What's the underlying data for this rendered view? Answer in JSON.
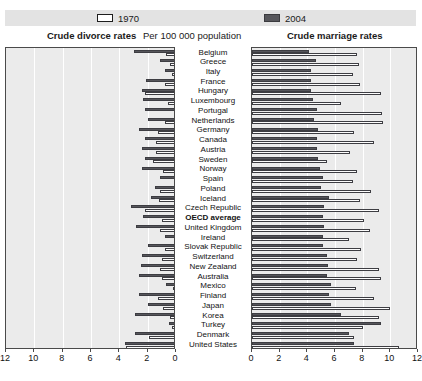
{
  "legend": {
    "items": [
      {
        "label": "1970",
        "swatch": "light-square-icon",
        "color": "#ffffff"
      },
      {
        "label": "2004",
        "swatch": "dark-square-icon",
        "color": "#56565b"
      }
    ]
  },
  "headers": {
    "left_title": "Crude divorce rates",
    "center_title": "Per 100 000 population",
    "right_title": "Crude marriage rates"
  },
  "footnote": "",
  "chart_data": {
    "type": "bar",
    "subtitle": "Per 100 000 population",
    "orientation": "horizontal",
    "layout": "back-to-back paired panels sharing a centered category axis",
    "legend_position": "top",
    "grid": true,
    "panels": [
      {
        "name": "left",
        "title": "Crude divorce rates",
        "xlabel": "",
        "xlim": [
          12,
          0
        ],
        "direction": "right-to-left",
        "ticks": [
          12,
          10,
          8,
          6,
          4,
          2,
          0
        ]
      },
      {
        "name": "right",
        "title": "Crude marriage rates",
        "xlabel": "",
        "xlim": [
          0,
          12
        ],
        "direction": "left-to-right",
        "ticks": [
          0,
          2,
          4,
          6,
          8,
          10,
          12
        ]
      }
    ],
    "categories": [
      "Belgium",
      "Greece",
      "Italy",
      "France",
      "Hungary",
      "Luxembourg",
      "Portugal",
      "Netherlands",
      "Germany",
      "Canada",
      "Austria",
      "Sweden",
      "Norway",
      "Spain",
      "Poland",
      "Iceland",
      "Czech Republic",
      "OECD average",
      "United Kingdom",
      "Ireland",
      "Slovak Republic",
      "Switzerland",
      "New Zealand",
      "Australia",
      "Mexico",
      "Finland",
      "Japan",
      "Korea",
      "Turkey",
      "Denmark",
      "United States"
    ],
    "emphasized_category": "OECD average",
    "series": [
      {
        "name": "1970",
        "color": "#ffffff",
        "divorce_rates": [
          0.7,
          0.4,
          0.3,
          0.8,
          2.2,
          0.6,
          0.1,
          0.8,
          1.3,
          1.4,
          1.4,
          1.6,
          0.9,
          0.0,
          1.1,
          1.2,
          2.2,
          1.0,
          1.1,
          0.0,
          0.8,
          1.0,
          1.1,
          1.0,
          0.2,
          1.3,
          0.9,
          0.4,
          0.3,
          1.9,
          3.5
        ],
        "marriage_rates": [
          7.6,
          7.7,
          7.3,
          7.8,
          9.3,
          6.4,
          9.4,
          9.5,
          7.4,
          8.8,
          7.1,
          5.4,
          7.6,
          7.3,
          8.6,
          7.8,
          9.2,
          8.1,
          8.5,
          7.0,
          7.9,
          7.6,
          9.2,
          9.3,
          7.5,
          8.8,
          10.0,
          9.2,
          8.0,
          7.4,
          10.6
        ]
      },
      {
        "name": "2004",
        "color": "#56565b",
        "divorce_rates": [
          3.0,
          1.1,
          0.8,
          2.1,
          2.4,
          2.3,
          2.2,
          2.0,
          2.6,
          2.2,
          2.4,
          2.2,
          2.4,
          1.1,
          1.5,
          1.8,
          3.2,
          2.3,
          2.8,
          0.8,
          2.0,
          2.4,
          2.5,
          2.6,
          0.7,
          2.6,
          2.0,
          2.9,
          0.5,
          2.9,
          3.6
        ],
        "marriage_rates": [
          4.1,
          4.6,
          4.3,
          4.3,
          4.3,
          4.4,
          4.7,
          4.5,
          4.8,
          4.7,
          4.7,
          4.8,
          4.9,
          5.1,
          5.0,
          5.6,
          5.2,
          5.1,
          5.2,
          5.1,
          5.1,
          5.4,
          5.5,
          5.4,
          5.7,
          5.6,
          5.7,
          6.4,
          9.3,
          7.0,
          7.4
        ]
      }
    ]
  }
}
